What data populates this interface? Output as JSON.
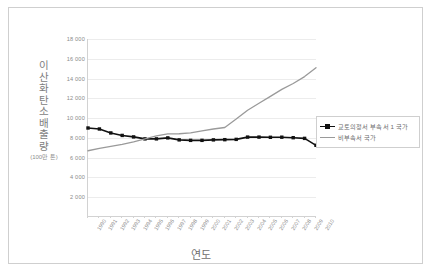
{
  "chart_data": {
    "type": "line",
    "title": "",
    "xlabel": "연도",
    "ylabel": "이산화탄소 배출량",
    "ylabel_unit": "(100만 톤)",
    "ylim": [
      0,
      18000
    ],
    "ytick_step": 2000,
    "ytick_labels": [
      "18 000",
      "16 000",
      "14 000",
      "12 000",
      "10 000",
      "8 000",
      "6 000",
      "4 000",
      "2 000"
    ],
    "ytick_values": [
      18000,
      16000,
      14000,
      12000,
      10000,
      8000,
      6000,
      4000,
      2000
    ],
    "grid": true,
    "legend_position": "right",
    "categories": [
      "1990",
      "1991",
      "1992",
      "1993",
      "1994",
      "1995",
      "1996",
      "1997",
      "1998",
      "1999",
      "2000",
      "2001",
      "2002",
      "2003",
      "2004",
      "2005",
      "2006",
      "2007",
      "2008",
      "2009",
      "2010"
    ],
    "series": [
      {
        "name": "교토의정서 부속서 1 국가",
        "color": "#111111",
        "marker": "square",
        "values": [
          9000,
          8900,
          8500,
          8250,
          8100,
          7900,
          7900,
          8000,
          7800,
          7750,
          7750,
          7800,
          7820,
          7850,
          8080,
          8080,
          8060,
          8070,
          8020,
          7950,
          7250
        ]
      },
      {
        "name": "비부속서 국가",
        "color": "#9a9a9a",
        "marker": "none",
        "values": [
          6700,
          6950,
          7150,
          7350,
          7600,
          7900,
          8200,
          8400,
          8420,
          8500,
          8700,
          8900,
          9050,
          9900,
          10800,
          11500,
          12200,
          12900,
          13500,
          14200,
          15100
        ]
      }
    ]
  },
  "legend": {
    "items": [
      {
        "label": "교토의정서 부속서 1 국가",
        "color": "#111111",
        "marker": "square"
      },
      {
        "label": "비부속서 국가",
        "color": "#9a9a9a",
        "marker": "line"
      }
    ]
  }
}
